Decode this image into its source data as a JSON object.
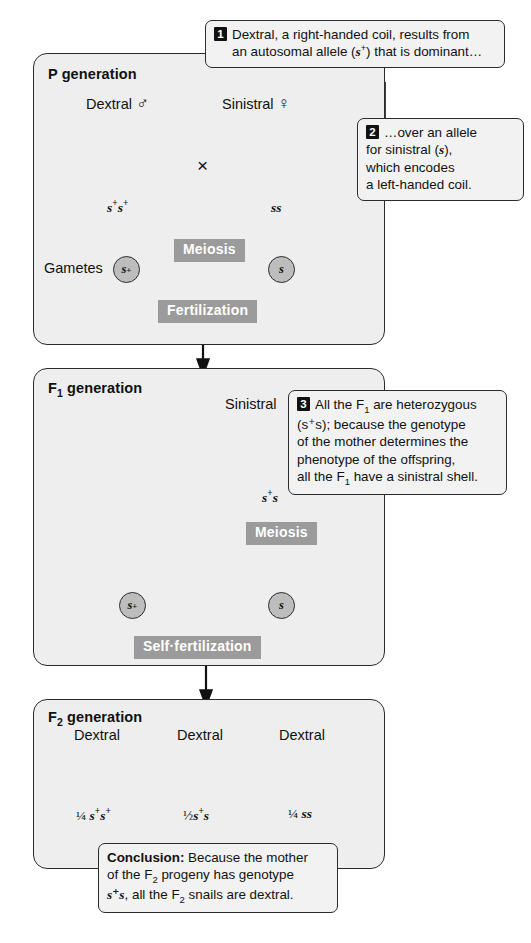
{
  "diagram": {
    "type": "genetic-cross-pedigree"
  },
  "panels": [
    {
      "id": "p-generation",
      "title": "P generation",
      "parents": [
        {
          "phenotype": "Dextral",
          "sex_symbol": "♂",
          "sex": "male",
          "genotype": "s⁺s⁺",
          "shell": "dextral"
        },
        {
          "phenotype": "Sinistral",
          "sex_symbol": "♀",
          "sex": "female",
          "genotype": "ss",
          "shell": "sinistral"
        }
      ],
      "cross_symbol": "×",
      "process_top": "Meiosis",
      "gametes_label": "Gametes",
      "gametes": [
        "s⁺",
        "s"
      ],
      "process_bottom": "Fertilization"
    },
    {
      "id": "f1-generation",
      "title": "F₁ generation",
      "offspring": {
        "phenotype": "Sinistral",
        "genotype": "s⁺s",
        "shell": "sinistral"
      },
      "process_top": "Meiosis",
      "gametes": [
        "s⁺",
        "s"
      ],
      "process_bottom": "Self·fertilization"
    },
    {
      "id": "f2-generation",
      "title": "F₂ generation",
      "offspring": [
        {
          "phenotype": "Dextral",
          "ratio": "¼",
          "genotype": "s⁺s⁺",
          "shell": "dextral"
        },
        {
          "phenotype": "Dextral",
          "ratio": "½",
          "genotype": "s⁺s",
          "shell": "dextral"
        },
        {
          "phenotype": "Dextral",
          "ratio": "¼",
          "genotype": "ss",
          "shell": "dextral"
        }
      ]
    }
  ],
  "callouts": [
    {
      "number": "1",
      "line1": "Dextral, a right-handed coil, results from",
      "line2_a": "an autosomal allele (",
      "line2_italic": "s",
      "line2_sup": "+",
      "line2_b": ") that is dominant…"
    },
    {
      "number": "2",
      "line1": "…over an allele",
      "line2_a": "for sinistral (",
      "line2_italic": "s",
      "line2_b": "),",
      "line3": "which encodes",
      "line4": "a left-handed coil."
    },
    {
      "number": "3",
      "line1_a": "All the F",
      "line1_sub": "1",
      "line1_b": " are heterozygous",
      "line2": "(s⁺s); because the genotype",
      "line3": "of the mother determines the",
      "line4": "phenotype of the offspring,",
      "line5_a": "all the F",
      "line5_sub": "1",
      "line5_b": " have a sinistral shell."
    }
  ],
  "conclusion": {
    "label": "Conclusion:",
    "line1": " Because the mother",
    "line2_a": "of the F",
    "line2_sub": "2",
    "line2_b": " progeny has genotype",
    "line3_italic": "s⁺s",
    "line3_a": ", all the F",
    "line3_sub": "2",
    "line3_b": " snails are dextral."
  },
  "colors": {
    "panel_fill": "#eeeeee",
    "panel_border": "#2b2b2b",
    "banner_fill": "#9b9b9b",
    "banner_text": "#ffffff",
    "gamete_fill": "#bdbdbd",
    "callout_fill": "#f2f2f2",
    "text": "#111111"
  }
}
